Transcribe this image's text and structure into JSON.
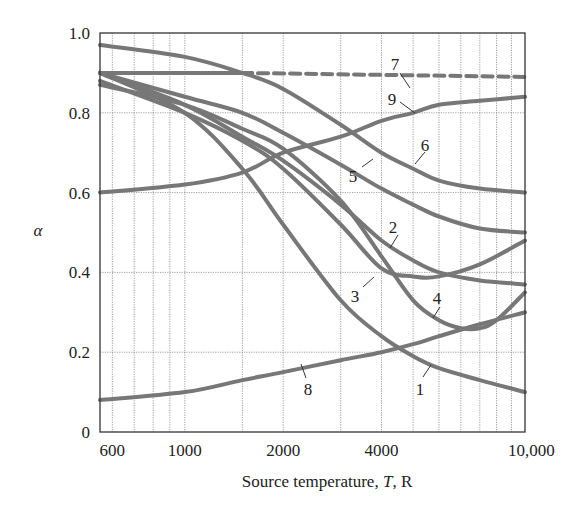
{
  "chart_data": {
    "type": "line",
    "title": "",
    "xlabel": "Source temperature, T, R",
    "ylabel": "α",
    "xscale": "log",
    "xlim": [
      550,
      11000
    ],
    "ylim": [
      0,
      1.0
    ],
    "x_ticks": [
      600,
      1000,
      2000,
      4000,
      10000
    ],
    "x_tick_labels": [
      "600",
      "1000",
      "2000",
      "4000",
      "10,000"
    ],
    "y_ticks": [
      0,
      0.2,
      0.4,
      0.6,
      0.8,
      1.0
    ],
    "y_tick_labels": [
      "0",
      "0.2",
      "0.4",
      "0.6",
      "0.8",
      "1.0"
    ],
    "x_minor_gridlines": [
      600,
      700,
      800,
      900,
      1000,
      1500,
      2000,
      3000,
      4000,
      5000,
      6000,
      7000,
      8000,
      9000,
      10000
    ],
    "grid": true,
    "legend": "none (curves labeled inline with numbers 1-9)",
    "series": [
      {
        "name": "1",
        "x": [
          550,
          1000,
          1500,
          2000,
          3000,
          4000,
          5000,
          6000,
          8000,
          11000
        ],
        "values": [
          0.9,
          0.8,
          0.66,
          0.52,
          0.33,
          0.24,
          0.19,
          0.16,
          0.13,
          0.1
        ],
        "style": "solid"
      },
      {
        "name": "2",
        "x": [
          550,
          1000,
          1500,
          2000,
          3000,
          4000,
          5000,
          6000,
          8000,
          11000
        ],
        "values": [
          0.9,
          0.82,
          0.74,
          0.68,
          0.57,
          0.48,
          0.43,
          0.4,
          0.38,
          0.37
        ],
        "style": "solid"
      },
      {
        "name": "3",
        "x": [
          550,
          1000,
          1500,
          2000,
          3000,
          4000,
          5000,
          6000,
          8000,
          11000
        ],
        "values": [
          0.88,
          0.8,
          0.73,
          0.66,
          0.52,
          0.41,
          0.39,
          0.39,
          0.42,
          0.48
        ],
        "style": "solid"
      },
      {
        "name": "4",
        "x": [
          550,
          1000,
          1500,
          2000,
          3000,
          4000,
          5000,
          6000,
          7000,
          8000,
          9000,
          11000
        ],
        "values": [
          0.87,
          0.82,
          0.76,
          0.71,
          0.58,
          0.44,
          0.33,
          0.28,
          0.26,
          0.26,
          0.28,
          0.35
        ],
        "style": "solid"
      },
      {
        "name": "5",
        "x": [
          550,
          1000,
          1500,
          2000,
          3000,
          4000,
          5000,
          6000,
          8000,
          11000
        ],
        "values": [
          0.9,
          0.84,
          0.8,
          0.75,
          0.67,
          0.61,
          0.57,
          0.54,
          0.51,
          0.5
        ],
        "style": "solid"
      },
      {
        "name": "6",
        "x": [
          550,
          1000,
          1500,
          2000,
          3000,
          4000,
          5000,
          6000,
          8000,
          11000
        ],
        "values": [
          0.97,
          0.94,
          0.9,
          0.86,
          0.77,
          0.7,
          0.66,
          0.63,
          0.61,
          0.6
        ],
        "style": "solid"
      },
      {
        "name": "7",
        "x": [
          550,
          1500,
          11000
        ],
        "values": [
          0.9,
          0.9,
          0.89
        ],
        "style": "solid until ~1500 R, then dashed"
      },
      {
        "name": "8",
        "x": [
          550,
          1000,
          1500,
          2000,
          3000,
          4000,
          5000,
          6000,
          8000,
          11000
        ],
        "values": [
          0.08,
          0.1,
          0.13,
          0.15,
          0.18,
          0.2,
          0.22,
          0.24,
          0.27,
          0.3
        ],
        "style": "solid"
      },
      {
        "name": "9",
        "x": [
          550,
          1000,
          1500,
          2000,
          3000,
          4000,
          5000,
          6000,
          8000,
          11000
        ],
        "values": [
          0.6,
          0.62,
          0.65,
          0.7,
          0.74,
          0.78,
          0.8,
          0.82,
          0.83,
          0.84
        ],
        "style": "solid"
      }
    ]
  }
}
